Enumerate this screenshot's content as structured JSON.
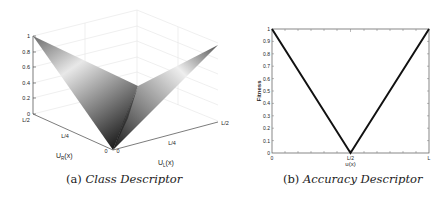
{
  "chart_data": [
    {
      "type": "surface3d",
      "title": "",
      "caption_label": "(a)",
      "caption_title": "Class Descriptor",
      "xlabel": "U_R(x)",
      "ylabel": "U_L(x)",
      "zlabel": "",
      "x_ticks": [
        "0",
        "L/4",
        "L/2"
      ],
      "y_ticks": [
        "0",
        "L/4",
        "L/2"
      ],
      "z_ticks": [
        "0",
        "0.2",
        "0.4",
        "0.6",
        "0.8",
        "1"
      ],
      "zlim": [
        0,
        1
      ],
      "description": "V-shaped (valley) surface: value 0 at origin, rising to 1 at U_R=L/2 and at U_L=L/2",
      "corners": [
        {
          "U_R": "0",
          "U_L": "0",
          "z": 0
        },
        {
          "U_R": "L/2",
          "U_L": "0",
          "z": 1
        },
        {
          "U_R": "0",
          "U_L": "L/2",
          "z": 1
        },
        {
          "U_R": "L/2",
          "U_L": "L/2",
          "z": 0.5
        }
      ],
      "colormap": "gray",
      "grid": true
    },
    {
      "type": "line",
      "title": "",
      "caption_label": "(b)",
      "caption_title": "Accuracy Descriptor",
      "xlabel": "u(x)",
      "ylabel": "Fitness",
      "x_ticks": [
        "0",
        "L/2",
        "L"
      ],
      "y_ticks": [
        "0",
        "0.1",
        "0.2",
        "0.3",
        "0.4",
        "0.5",
        "0.6",
        "0.7",
        "0.8",
        "0.9",
        "1"
      ],
      "ylim": [
        0,
        1
      ],
      "series": [
        {
          "name": "Fitness",
          "x": [
            "0",
            "L/2",
            "L"
          ],
          "x_numeric": [
            0,
            0.5,
            1
          ],
          "values": [
            1,
            0,
            1
          ],
          "color": "#111111"
        }
      ],
      "grid": false
    }
  ],
  "captions": {
    "a_label": "(a)",
    "a_title": "Class Descriptor",
    "b_label": "(b)",
    "b_title": "Accuracy Descriptor"
  },
  "left": {
    "z_ticks": [
      "1",
      "0.8",
      "0.6",
      "0.4",
      "0.2",
      "0"
    ],
    "x_ticks": [
      "L/2",
      "L/4",
      "0"
    ],
    "y_ticks": [
      "0",
      "L/4",
      "L/2"
    ],
    "xlabel_main": "U",
    "xlabel_sub": "R",
    "xlabel_arg": "(x)",
    "ylabel_main": "U",
    "ylabel_sub": "L",
    "ylabel_arg": "(x)"
  },
  "right": {
    "y_ticks": [
      "1",
      "0.9",
      "0.8",
      "0.7",
      "0.6",
      "0.5",
      "0.4",
      "0.3",
      "0.2",
      "0.1",
      "0"
    ],
    "x_ticks": [
      "0",
      "L/2",
      "L"
    ],
    "xlabel": "u(x)",
    "ylabel": "Fitness"
  }
}
